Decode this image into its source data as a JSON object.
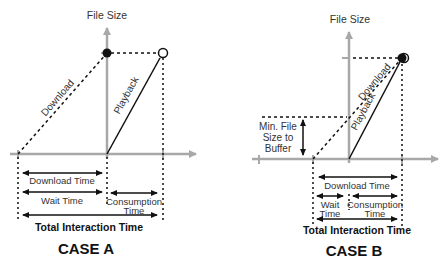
{
  "case_a": {
    "title": "CASE A",
    "y_axis_label": "File Size",
    "download_label": "Download",
    "playback_label": "Playback",
    "download_time_label": "Download Time",
    "wait_time_label": "Wait Time",
    "consumption_time_label_1": "Consumption",
    "consumption_time_label_2": "Time",
    "total_label": "Total Interaction Time"
  },
  "case_b": {
    "title": "CASE B",
    "y_axis_label": "File Size",
    "download_label": "Download",
    "playback_label": "Playback",
    "min_buffer_label_1": "Min. File",
    "min_buffer_label_2": "Size to",
    "min_buffer_label_3": "Buffer",
    "download_time_label": "Download Time",
    "wait_time_label_1": "Wait",
    "wait_time_label_2": "Time",
    "consumption_time_label_1": "Consumption",
    "consumption_time_label_2": "Time",
    "total_label": "Total Interaction Time"
  },
  "colors": {
    "axis": "#a8a8a8",
    "line": "#111111",
    "text": "#333333"
  }
}
